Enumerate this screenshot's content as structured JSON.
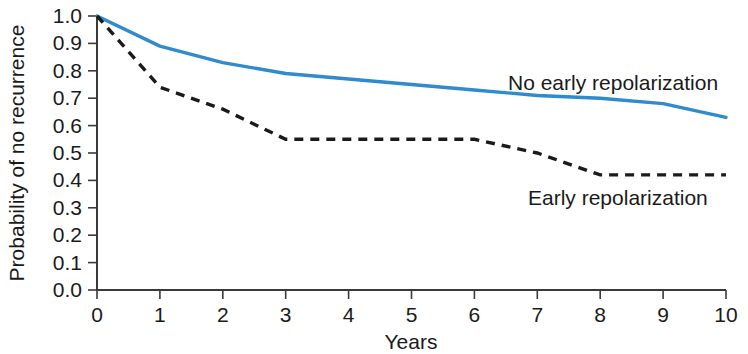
{
  "chart_data": {
    "type": "line",
    "title": "",
    "xlabel": "Years",
    "ylabel": "Probability of no recurrence",
    "xlim": [
      0,
      10
    ],
    "ylim": [
      0,
      1.0
    ],
    "grid": false,
    "legend_position": "inline-annotation",
    "xticks": [
      "0",
      "1",
      "2",
      "3",
      "4",
      "5",
      "6",
      "7",
      "8",
      "9",
      "10"
    ],
    "yticks": [
      "0.0",
      "0.1",
      "0.2",
      "0.3",
      "0.4",
      "0.5",
      "0.6",
      "0.7",
      "0.8",
      "0.9",
      "1.0"
    ],
    "x": [
      0,
      1,
      2,
      3,
      4,
      5,
      6,
      7,
      8,
      9,
      10
    ],
    "series": [
      {
        "name": "No early repolarization",
        "style": "solid",
        "color": "#2f8ace",
        "values": [
          1.0,
          0.89,
          0.83,
          0.79,
          0.77,
          0.75,
          0.73,
          0.71,
          0.7,
          0.68,
          0.63
        ],
        "annotation": "No early repolarization"
      },
      {
        "name": "Early repolarization",
        "style": "dashed",
        "color": "#1a1a1a",
        "values": [
          1.0,
          0.74,
          0.66,
          0.55,
          0.55,
          0.55,
          0.55,
          0.5,
          0.42,
          0.42,
          0.42
        ],
        "annotation": "Early repolarization"
      }
    ],
    "annotations": [
      {
        "text": "No early repolarization",
        "x": 7.1,
        "y": 0.8
      },
      {
        "text": "Early repolarization",
        "x": 6.6,
        "y": 0.32
      }
    ]
  },
  "colors": {
    "solid_series": "#2f8ace",
    "dashed_series": "#1a1a1a",
    "axis": "#3a3a3a",
    "background": "#ffffff"
  }
}
